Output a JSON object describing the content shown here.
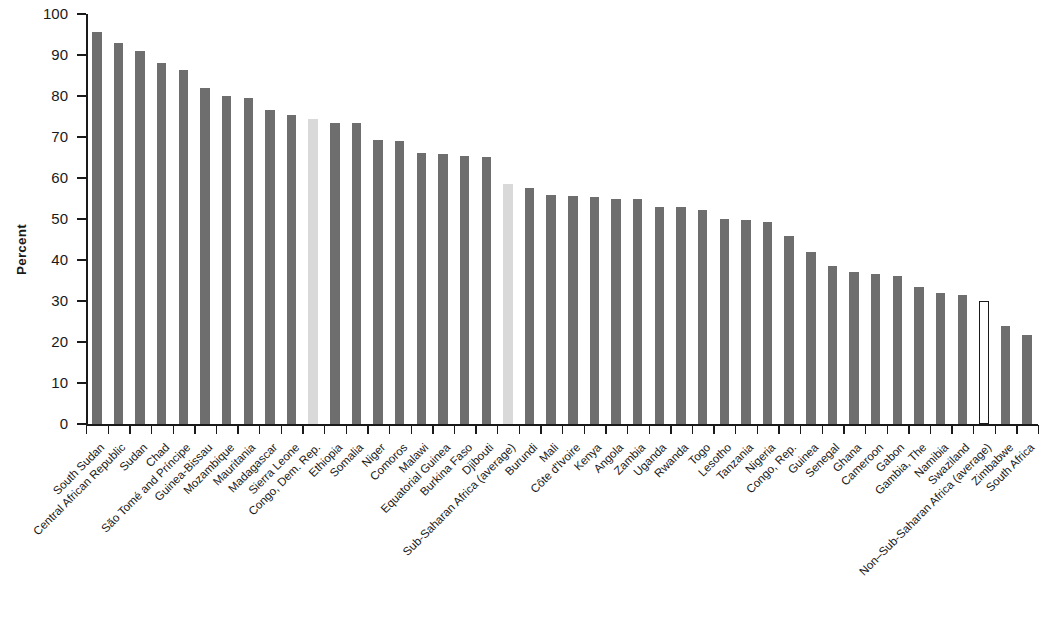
{
  "chart_data": {
    "type": "bar",
    "title": "",
    "subtitle": "",
    "xlabel": "",
    "ylabel": "Percent",
    "ylim": [
      0,
      100
    ],
    "yticks": [
      0,
      10,
      20,
      30,
      40,
      50,
      60,
      70,
      80,
      90,
      100
    ],
    "grid": false,
    "legend": [],
    "series_name": "Percent",
    "categories": [
      "South Sudan",
      "Central African Republic",
      "Sudan",
      "Chad",
      "São Tomé and Príncipe",
      "Guinea-Bissau",
      "Mozambique",
      "Mauritania",
      "Madagascar",
      "Sierra Leone",
      "Congo, Dem. Rep.",
      "Ethiopia",
      "Somalia",
      "Niger",
      "Comoros",
      "Malawi",
      "Equatorial Guinea",
      "Burkina Faso",
      "Djibouti",
      "Sub-Saharan Africa (average)",
      "Burundi",
      "Mali",
      "Côte d'Ivoire",
      "Kenya",
      "Angola",
      "Zambia",
      "Uganda",
      "Rwanda",
      "Togo",
      "Lesotho",
      "Tanzania",
      "Nigeria",
      "Congo, Rep.",
      "Guinea",
      "Senegal",
      "Ghana",
      "Cameroon",
      "Gabon",
      "Gambia, The",
      "Namibia",
      "Swaziland",
      "Non–Sub-Saharan Africa (average)",
      "Zimbabwe",
      "South Africa"
    ],
    "values": [
      95.5,
      93.0,
      91.0,
      88.0,
      86.3,
      82.0,
      80.0,
      79.5,
      76.5,
      75.3,
      74.5,
      73.5,
      73.3,
      69.3,
      69.0,
      66.0,
      65.8,
      65.3,
      65.2,
      58.5,
      57.5,
      55.8,
      55.5,
      55.3,
      55.0,
      54.8,
      53.0,
      53.0,
      52.2,
      50.0,
      49.8,
      49.3,
      45.8,
      42.0,
      38.5,
      37.0,
      36.5,
      36.0,
      33.5,
      32.0,
      31.5,
      30.0,
      24.0,
      21.8
    ],
    "bar_styles": [
      "solid",
      "solid",
      "solid",
      "solid",
      "solid",
      "solid",
      "solid",
      "solid",
      "solid",
      "solid",
      "light",
      "solid",
      "solid",
      "solid",
      "solid",
      "solid",
      "solid",
      "solid",
      "solid",
      "light",
      "solid",
      "solid",
      "solid",
      "solid",
      "solid",
      "solid",
      "solid",
      "solid",
      "solid",
      "solid",
      "solid",
      "solid",
      "solid",
      "solid",
      "solid",
      "solid",
      "solid",
      "solid",
      "solid",
      "solid",
      "solid",
      "hollow",
      "solid",
      "solid"
    ]
  },
  "colors": {
    "bar_solid": "#6e6e6e",
    "bar_light": "#d9d9d9",
    "bar_hollow_fill": "#ffffff",
    "bar_hollow_stroke": "#1a1a1a",
    "axis": "#1a1a1a",
    "background": "#ffffff"
  }
}
